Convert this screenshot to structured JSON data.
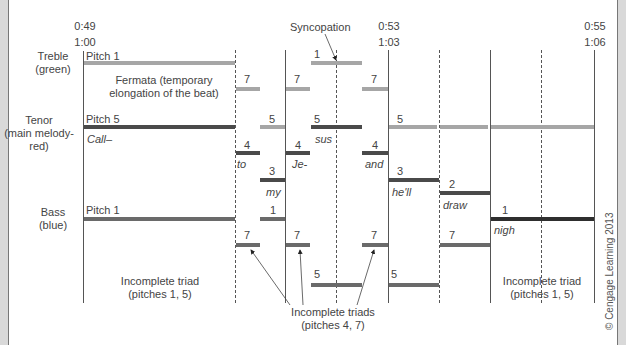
{
  "timestamps": {
    "start": {
      "top": "0:49",
      "bottom": "1:00"
    },
    "mid": {
      "top": "0:53",
      "bottom": "1:03"
    },
    "end": {
      "top": "0:55",
      "bottom": "1:06"
    }
  },
  "voices": {
    "treble": {
      "line1": "Treble",
      "line2": "(green)"
    },
    "tenor": {
      "line1": "Tenor",
      "line2": "(main melody-",
      "line3": "red)"
    },
    "bass": {
      "line1": "Bass",
      "line2": "(blue)"
    }
  },
  "annotations": {
    "syncopation": "Syncopation",
    "fermata_line1": "Fermata (temporary",
    "fermata_line2": "elongation of the beat)",
    "incomplete_triad_left_1": "Incomplete triad",
    "incomplete_triad_left_2": "(pitches 1, 5)",
    "incomplete_triad_right_1": "Incomplete triad",
    "incomplete_triad_right_2": "(pitches 1, 5)",
    "incomplete_triads_1": "Incomplete triads",
    "incomplete_triads_2": "(pitches 4, 7)",
    "copyright": "© Cengage Learning 2013"
  },
  "notes": {
    "treble": [
      {
        "label": "Pitch 1"
      },
      {
        "label": "7"
      },
      {
        "label": "7"
      },
      {
        "label": "1"
      },
      {
        "label": "7"
      }
    ],
    "tenor": [
      {
        "label": "Pitch 5",
        "lyric": "Call–"
      },
      {
        "label": "4",
        "lyric": "to"
      },
      {
        "label": "5"
      },
      {
        "label": "3",
        "lyric": "my"
      },
      {
        "label": "4",
        "lyric": "Je-"
      },
      {
        "label": "5",
        "lyric": "sus"
      },
      {
        "label": "4",
        "lyric": "and"
      },
      {
        "label": "5"
      },
      {
        "label": "3",
        "lyric": "he'll"
      },
      {
        "label": "2",
        "lyric": "draw"
      },
      {
        "label": "1",
        "lyric": "nigh"
      }
    ],
    "bass": [
      {
        "label": "Pitch 1"
      },
      {
        "label": "7"
      },
      {
        "label": "1"
      },
      {
        "label": "7"
      },
      {
        "label": "5"
      },
      {
        "label": "7"
      },
      {
        "label": "5"
      },
      {
        "label": "7"
      }
    ]
  },
  "colors": {
    "treble": "#a6a6a6",
    "tenor": "#4a4a4a",
    "bass": "#6a6a6a"
  }
}
